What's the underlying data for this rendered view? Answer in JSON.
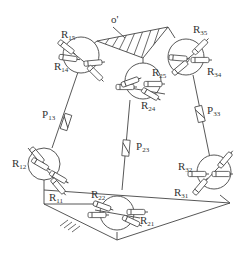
{
  "diagram": {
    "platform_label": "o'",
    "joints": [
      {
        "id": "j1_top",
        "labels": [
          {
            "base": "R",
            "sub": "15"
          },
          {
            "base": "R",
            "sub": "14"
          }
        ]
      },
      {
        "id": "j2_top",
        "labels": [
          {
            "base": "R",
            "sub": "25"
          },
          {
            "base": "R",
            "sub": "24"
          }
        ]
      },
      {
        "id": "j3_top",
        "labels": [
          {
            "base": "R",
            "sub": "35"
          },
          {
            "base": "R",
            "sub": "34"
          }
        ]
      },
      {
        "id": "j1_bottom",
        "labels": [
          {
            "base": "R",
            "sub": "12"
          },
          {
            "base": "R",
            "sub": "11"
          }
        ]
      },
      {
        "id": "j2_bottom",
        "labels": [
          {
            "base": "R",
            "sub": "22"
          },
          {
            "base": "R",
            "sub": "21"
          }
        ]
      },
      {
        "id": "j3_bottom",
        "labels": [
          {
            "base": "R",
            "sub": "32"
          },
          {
            "base": "R",
            "sub": "31"
          }
        ]
      }
    ],
    "prismatic": [
      {
        "base": "P",
        "sub": "13"
      },
      {
        "base": "P",
        "sub": "23"
      },
      {
        "base": "P",
        "sub": "33"
      }
    ]
  },
  "labels": {
    "o": "o'",
    "R15": "R",
    "R15s": "15",
    "R14": "R",
    "R14s": "14",
    "R25": "R",
    "R25s": "25",
    "R24": "R",
    "R24s": "24",
    "R35": "R",
    "R35s": "35",
    "R34": "R",
    "R34s": "34",
    "R12": "R",
    "R12s": "12",
    "R11": "R",
    "R11s": "11",
    "R22": "R",
    "R22s": "22",
    "R21": "R",
    "R21s": "21",
    "R32": "R",
    "R32s": "32",
    "R31": "R",
    "R31s": "31",
    "P13": "P",
    "P13s": "13",
    "P23": "P",
    "P23s": "23",
    "P33": "P",
    "P33s": "33"
  }
}
